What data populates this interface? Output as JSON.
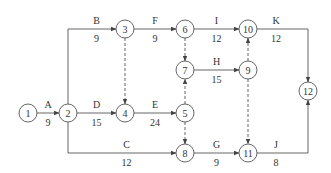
{
  "diagram": {
    "type": "activity-on-arrow network",
    "colors": {
      "line": "#555555",
      "text": "#333333",
      "background": "#ffffff"
    },
    "nodes": [
      {
        "id": "1",
        "x": 28,
        "y": 113
      },
      {
        "id": "2",
        "x": 68,
        "y": 113
      },
      {
        "id": "3",
        "x": 125,
        "y": 29
      },
      {
        "id": "4",
        "x": 125,
        "y": 113
      },
      {
        "id": "5",
        "x": 185,
        "y": 113
      },
      {
        "id": "6",
        "x": 185,
        "y": 29
      },
      {
        "id": "7",
        "x": 185,
        "y": 70
      },
      {
        "id": "8",
        "x": 185,
        "y": 153
      },
      {
        "id": "9",
        "x": 248,
        "y": 70
      },
      {
        "id": "10",
        "x": 248,
        "y": 29
      },
      {
        "id": "11",
        "x": 248,
        "y": 153
      },
      {
        "id": "12",
        "x": 308,
        "y": 91
      }
    ],
    "activities": [
      {
        "name": "A",
        "duration": "9",
        "from": "1",
        "to": "2"
      },
      {
        "name": "B",
        "duration": "9",
        "from": "2",
        "to": "3"
      },
      {
        "name": "C",
        "duration": "12",
        "from": "2",
        "to": "8"
      },
      {
        "name": "D",
        "duration": "15",
        "from": "2",
        "to": "4"
      },
      {
        "name": "E",
        "duration": "24",
        "from": "4",
        "to": "5"
      },
      {
        "name": "F",
        "duration": "9",
        "from": "3",
        "to": "6"
      },
      {
        "name": "G",
        "duration": "9",
        "from": "8",
        "to": "11"
      },
      {
        "name": "H",
        "duration": "15",
        "from": "7",
        "to": "9"
      },
      {
        "name": "I",
        "duration": "12",
        "from": "6",
        "to": "10"
      },
      {
        "name": "J",
        "duration": "8",
        "from": "11",
        "to": "12"
      },
      {
        "name": "K",
        "duration": "12",
        "from": "10",
        "to": "12"
      }
    ],
    "dummies": [
      {
        "from": "3",
        "to": "4"
      },
      {
        "from": "6",
        "to": "7"
      },
      {
        "from": "5",
        "to": "7"
      },
      {
        "from": "5",
        "to": "8"
      },
      {
        "from": "9",
        "to": "10"
      },
      {
        "from": "9",
        "to": "11"
      }
    ]
  }
}
